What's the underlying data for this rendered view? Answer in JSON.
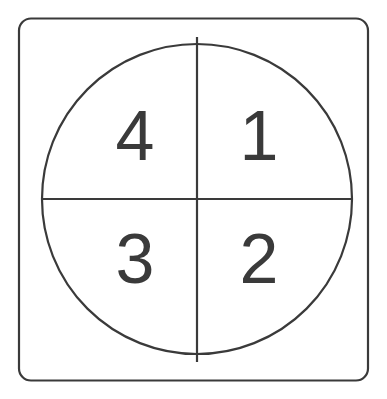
{
  "canvas": {
    "width": 387,
    "height": 399,
    "background_color": "#ffffff"
  },
  "diagram": {
    "type": "circle-divided-into-four-quadrants",
    "stroke_color": "#3a3a3a",
    "stroke_width": 2.2,
    "label_color": "#3a3a3a",
    "label_font_size": 70
  },
  "frame": {
    "shape": "rounded-rectangle",
    "x": 19,
    "y": 18.5,
    "width": 349,
    "height": 362,
    "corner_radius": 12
  },
  "circle": {
    "center_x": 197,
    "center_y": 199,
    "radius": 155,
    "left": 42,
    "right": 352,
    "top": 44,
    "bottom": 354
  },
  "dividers": {
    "vertical": {
      "x": 197,
      "y1": 37,
      "y2": 362
    },
    "horizontal": {
      "y": 199,
      "x1": 42,
      "x2": 352
    }
  },
  "quadrants": [
    {
      "id": "quadrant-1",
      "label": "1",
      "position": "upper-right",
      "cx": 259,
      "cy": 140
    },
    {
      "id": "quadrant-2",
      "label": "2",
      "position": "lower-right",
      "cx": 259,
      "cy": 263
    },
    {
      "id": "quadrant-3",
      "label": "3",
      "position": "lower-left",
      "cx": 135,
      "cy": 263
    },
    {
      "id": "quadrant-4",
      "label": "4",
      "position": "upper-left",
      "cx": 135,
      "cy": 140
    }
  ]
}
